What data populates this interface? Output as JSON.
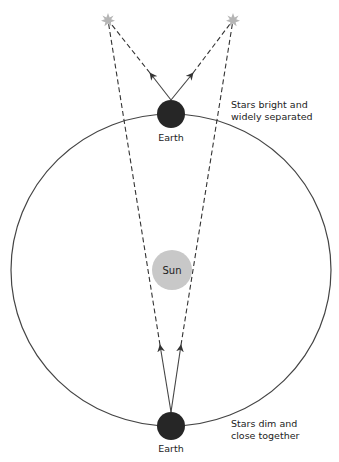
{
  "diagram": {
    "colors": {
      "orbit": "#444444",
      "earth": "#262626",
      "sun": "#c8c8c8",
      "star": "#b0b0b0",
      "lines": "#333333"
    },
    "stars": [
      {
        "id": "star-left",
        "x": 108,
        "y": 20
      },
      {
        "id": "star-right",
        "x": 233,
        "y": 20
      }
    ],
    "sun": {
      "label": "Sun",
      "x": 172,
      "y": 270,
      "r": 20
    },
    "orbit": {
      "cx": 171,
      "cy": 270,
      "rx": 160,
      "ry": 156
    },
    "earths": [
      {
        "position": "top",
        "label": "Earth",
        "x": 171,
        "y": 114,
        "r": 14,
        "note_line1": "Stars bright and",
        "note_line2": "widely separated"
      },
      {
        "position": "bottom",
        "label": "Earth",
        "x": 171,
        "y": 426,
        "r": 14,
        "note_line1": "Stars dim and",
        "note_line2": "close together"
      }
    ]
  }
}
